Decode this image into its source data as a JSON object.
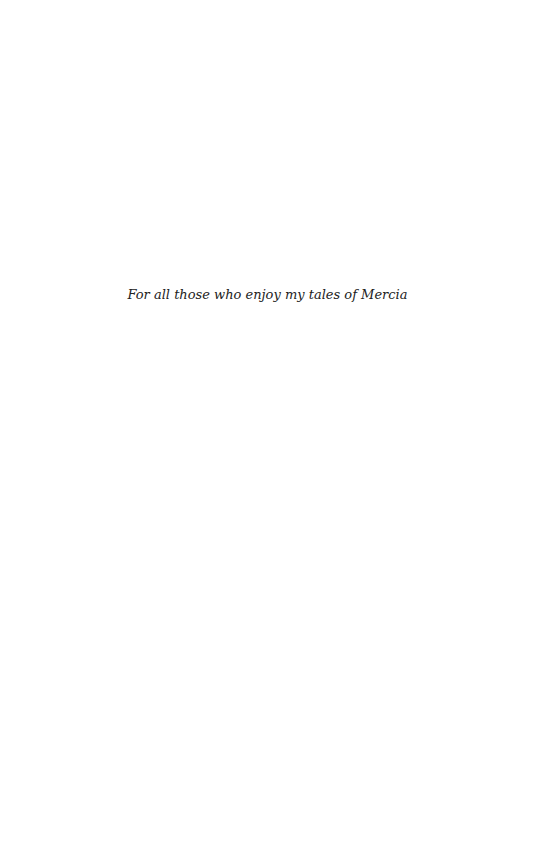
{
  "page": {
    "type": "dedication",
    "dedication_text": "For all those who enjoy my tales of Mercia"
  }
}
